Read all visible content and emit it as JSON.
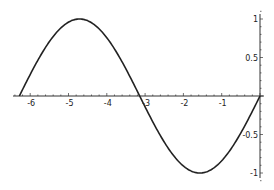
{
  "chart_data": {
    "type": "line",
    "title": "",
    "xlabel": "",
    "ylabel": "",
    "function": "sin(x)",
    "xlim": [
      -6.5,
      0.1
    ],
    "ylim": [
      -1.1,
      1.1
    ],
    "grid": false,
    "legend": null,
    "x_ticks": [
      -6,
      -5,
      -4,
      -3,
      -2,
      -1
    ],
    "x_tick_labels": [
      "-6",
      "-5",
      "-4",
      "-3",
      "-2",
      "-1"
    ],
    "y_ticks": [
      1,
      0.5,
      -0.5,
      -1
    ],
    "y_tick_labels": [
      "1",
      "0.5",
      "-0.5",
      "-1"
    ],
    "series": [
      {
        "name": "sin(x)",
        "color": "#222222",
        "x": [
          -6.2832,
          -5.4978,
          -4.7124,
          -3.927,
          -3.1416,
          -2.3562,
          -1.5708,
          -0.7854,
          0
        ],
        "y": [
          0,
          0.7071,
          1,
          0.7071,
          0,
          -0.7071,
          -1,
          -0.7071,
          0
        ]
      }
    ]
  },
  "axes": {
    "axis_color": "#333333",
    "curve_color": "#222222",
    "origin_px": [
      260,
      96
    ],
    "x_px_per_unit": 38.3,
    "y_px_per_unit": 77,
    "x_axis_start_px": 13,
    "y_axis_top_px": 14,
    "y_axis_bottom_px": 178
  }
}
